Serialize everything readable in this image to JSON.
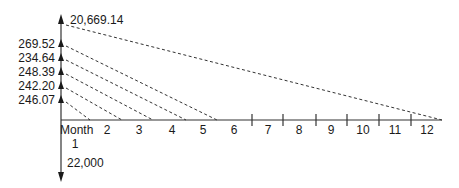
{
  "diagram": {
    "type": "cash-flow-diagram",
    "colors": {
      "line": "#333333",
      "text": "#1a1a1a",
      "background": "#ffffff"
    },
    "present_value": {
      "label": "20,669.14",
      "direction": "up"
    },
    "payments": [
      {
        "label": "269.52",
        "direction": "up"
      },
      {
        "label": "234.64",
        "direction": "up"
      },
      {
        "label": "248.39",
        "direction": "up"
      },
      {
        "label": "242.20",
        "direction": "up"
      },
      {
        "label": "246.07",
        "direction": "up"
      }
    ],
    "initial_outflow": {
      "label": "22,000",
      "direction": "down"
    },
    "time_axis": {
      "unit_label": "Month",
      "periods": [
        "1",
        "2",
        "3",
        "4",
        "5",
        "6",
        "7",
        "8",
        "9",
        "10",
        "11",
        "12"
      ]
    }
  }
}
